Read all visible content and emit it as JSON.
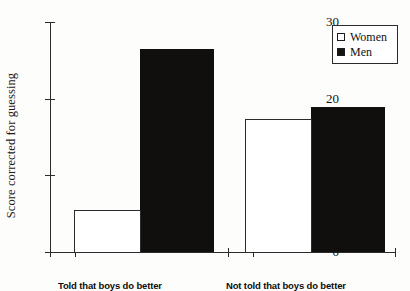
{
  "chart_data": {
    "type": "bar",
    "title": "",
    "xlabel": "",
    "ylabel": "Score corrected for guessing",
    "categories": [
      "Told that boys do better",
      "Not told that boys do better"
    ],
    "series": [
      {
        "name": "Women",
        "values": [
          5.5,
          17.3
        ],
        "fill": "#ffffff",
        "edge": "#2b2b2b"
      },
      {
        "name": "Men",
        "values": [
          26.5,
          18.9
        ],
        "fill": "#100f0d",
        "edge": "#100f0d"
      }
    ],
    "ylim": [
      0,
      30
    ],
    "yticks": [
      0,
      10,
      20,
      30
    ],
    "ytick_labels": [
      "0",
      "10",
      "20",
      "30"
    ],
    "grid": false,
    "legend_position": "top-right",
    "legend_entries": [
      "Women",
      "Men"
    ]
  },
  "axes": {
    "y_title": "Score corrected for guessing",
    "y_ticks": [
      {
        "label": "30",
        "value": 30
      },
      {
        "label": "20",
        "value": 20
      },
      {
        "label": "10",
        "value": 10
      },
      {
        "label": "0",
        "value": 0
      }
    ]
  },
  "legend": {
    "women_label": "Women",
    "men_label": "Men",
    "women_swatch": "open-square-icon",
    "men_swatch": "filled-square-icon"
  },
  "groups": [
    {
      "label": "Told that boys do better"
    },
    {
      "label": "Not told that boys do better"
    }
  ],
  "colors": {
    "men_fill": "#100f0d",
    "women_fill": "#ffffff",
    "axis": "#2b2b2b",
    "text": "#111111",
    "background": "#fdfdfc"
  }
}
